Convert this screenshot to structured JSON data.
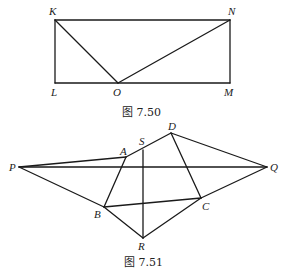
{
  "figures": [
    {
      "id": "fig-7-50",
      "caption": "图 7.50",
      "points": {
        "K": {
          "label": "K",
          "x": 55,
          "y": 20
        },
        "N": {
          "label": "N",
          "x": 230,
          "y": 20
        },
        "L": {
          "label": "L",
          "x": 55,
          "y": 83
        },
        "M": {
          "label": "M",
          "x": 230,
          "y": 83
        },
        "O": {
          "label": "O",
          "x": 118,
          "y": 83
        }
      },
      "segments": [
        [
          "K",
          "N"
        ],
        [
          "N",
          "M"
        ],
        [
          "M",
          "L"
        ],
        [
          "L",
          "K"
        ],
        [
          "K",
          "O"
        ],
        [
          "O",
          "N"
        ]
      ]
    },
    {
      "id": "fig-7-51",
      "caption": "图 7.51",
      "points": {
        "P": {
          "label": "P",
          "x": 19,
          "y": 167
        },
        "A": {
          "label": "A",
          "x": 126,
          "y": 157
        },
        "S": {
          "label": "S",
          "x": 143,
          "y": 150
        },
        "D": {
          "label": "D",
          "x": 171,
          "y": 133
        },
        "Q": {
          "label": "Q",
          "x": 267,
          "y": 167
        },
        "B": {
          "label": "B",
          "x": 104,
          "y": 207
        },
        "C": {
          "label": "C",
          "x": 201,
          "y": 198
        },
        "R": {
          "label": "R",
          "x": 143,
          "y": 238
        }
      },
      "segments": [
        [
          "P",
          "A"
        ],
        [
          "P",
          "Q"
        ],
        [
          "P",
          "B"
        ],
        [
          "A",
          "D"
        ],
        [
          "A",
          "B"
        ],
        [
          "S",
          "R"
        ],
        [
          "D",
          "Q"
        ],
        [
          "D",
          "C"
        ],
        [
          "B",
          "C"
        ],
        [
          "C",
          "Q"
        ],
        [
          "B",
          "R"
        ],
        [
          "R",
          "C"
        ]
      ]
    }
  ]
}
